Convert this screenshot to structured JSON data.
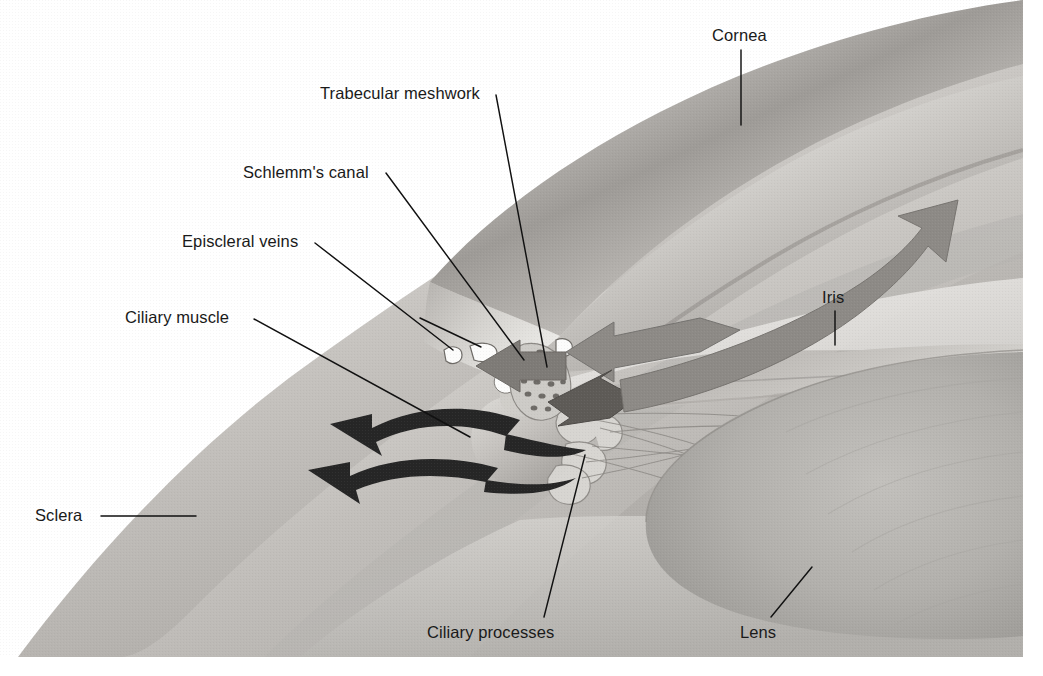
{
  "figure": {
    "type": "anatomical-illustration",
    "background_color": "#ffffff",
    "canvas": {
      "width": 1043,
      "height": 676
    }
  },
  "palette": {
    "ink": "#111111",
    "label_text": "#1a1a1a",
    "sclera_light": "#e8e6e3",
    "sclera_mid": "#c9c6c2",
    "sclera_shadow": "#9d9a96",
    "cornea_light": "#f0eeec",
    "cornea_mid": "#cfcdc9",
    "cornea_edge": "#8e8b87",
    "iris_gray": "#b9b7b3",
    "lens_gray": "#b3b1ad",
    "lens_dark": "#a09e9a",
    "arrow_gray": "#8d8a86",
    "arrow_dark": "#2b2b2b",
    "vein_white": "#fbfbfa",
    "meshwork_speckle": "#6e6b67"
  },
  "labels": [
    {
      "id": "trabecular-meshwork",
      "text": "Trabecular meshwork",
      "text_x": 320,
      "text_y": 99,
      "anchor": "start",
      "leader": "M 496,95 L 547,367"
    },
    {
      "id": "schlemms-canal",
      "text": "Schlemm's canal",
      "text_x": 243,
      "text_y": 178,
      "anchor": "start",
      "leader": "M 386,173 L 524,360"
    },
    {
      "id": "episcleral-veins",
      "text": "Episcleral veins",
      "text_x": 182,
      "text_y": 247,
      "anchor": "start",
      "leader": "M 315,243 L 453,350 M 420,318 L 481,347"
    },
    {
      "id": "ciliary-muscle",
      "text": "Ciliary muscle",
      "text_x": 125,
      "text_y": 323,
      "anchor": "start",
      "leader": "M 254,319 L 470,437"
    },
    {
      "id": "sclera",
      "text": "Sclera",
      "text_x": 35,
      "text_y": 521,
      "anchor": "start",
      "leader": "M 101,516 L 196,516"
    },
    {
      "id": "cornea",
      "text": "Cornea",
      "text_x": 712,
      "text_y": 41,
      "anchor": "start",
      "leader": "M 741,50 L 741,125"
    },
    {
      "id": "iris",
      "text": "Iris",
      "text_x": 822,
      "text_y": 303,
      "anchor": "start",
      "leader": "M 835,311 L 835,345"
    },
    {
      "id": "ciliary-processes",
      "text": "Ciliary processes",
      "text_x": 427,
      "text_y": 638,
      "anchor": "start",
      "leader": "M 544,617 L 585,455"
    },
    {
      "id": "lens",
      "text": "Lens",
      "text_x": 740,
      "text_y": 638,
      "anchor": "start",
      "leader": "M 771,617 L 812,567"
    }
  ],
  "flow_arrows": [
    {
      "id": "uveoscleral-outflow-upper",
      "style": "dark-curved",
      "direction": "up-left"
    },
    {
      "id": "uveoscleral-outflow-lower",
      "style": "dark-curved",
      "direction": "up-left"
    },
    {
      "id": "trabecular-outflow-left",
      "style": "gray-solid",
      "direction": "left"
    },
    {
      "id": "anterior-chamber-inflow",
      "style": "gray-solid",
      "direction": "left"
    },
    {
      "id": "posterior-chamber-inflow",
      "style": "gray-solid",
      "direction": "down-left"
    },
    {
      "id": "aqueous-circulation-up",
      "style": "gray-curved",
      "direction": "up-right"
    }
  ]
}
